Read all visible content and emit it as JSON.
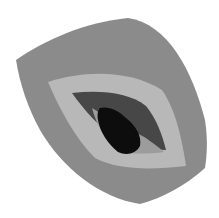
{
  "image": {
    "subject": "stylized eye icon",
    "width": 219,
    "height": 218
  },
  "colors": {
    "background": "#ffffff",
    "outer_leaf": "#8b8b8b",
    "light_ring": "#b8b8b8",
    "eye_dark": "#474747",
    "iris": "#9c9c9c",
    "pupil": "#0d0d0d"
  },
  "icons": [
    "eye-icon"
  ]
}
